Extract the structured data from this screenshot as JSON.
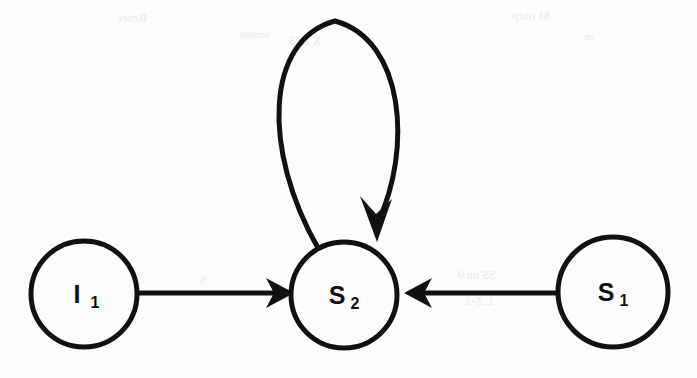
{
  "diagram": {
    "background_color": "#fdfdfd",
    "ink_color": "#111111",
    "nodes": [
      {
        "id": "I1",
        "name": "initial-state-node",
        "label_main": "I",
        "label_sub": "1",
        "cx": 84,
        "cy": 294,
        "r": 53,
        "stroke_width": 5
      },
      {
        "id": "S2",
        "name": "state-node-s2",
        "label_main": "S",
        "label_sub": "2",
        "cx": 344,
        "cy": 295,
        "r": 53,
        "stroke_width": 5
      },
      {
        "id": "S1",
        "name": "state-node-s1",
        "label_main": "S",
        "label_sub": "1",
        "cx": 613,
        "cy": 292,
        "r": 55,
        "stroke_width": 5
      }
    ],
    "edges": [
      {
        "id": "e-i1-s2",
        "name": "transition-i1-to-s2",
        "from": "I1",
        "to": "S2",
        "kind": "straight",
        "direction": "right",
        "label": "",
        "path": "M 139 293 L 278 293",
        "stroke_width": 5,
        "arrowhead": "266,278 294,293 266,308 274,293"
      },
      {
        "id": "e-s1-s2",
        "name": "transition-s1-to-s2",
        "from": "S1",
        "to": "S2",
        "kind": "straight",
        "direction": "left",
        "label": "",
        "path": "M 557 293 L 420 293",
        "stroke_width": 5,
        "arrowhead": "432,278 404,293 432,308 424,293"
      },
      {
        "id": "e-s2-s2",
        "name": "self-loop-s2",
        "from": "S2",
        "to": "S2",
        "kind": "self-loop",
        "direction": "clockwise",
        "label": "",
        "path": "M 318 248 C 262 150 265 40 335 21 C 405 40 412 150 378 222",
        "stroke_width": 5,
        "arrowhead": "360,196 377,242 392,199 376,214"
      }
    ],
    "bleed_through": [
      {
        "text": "Reset",
        "x": 118,
        "y": 10,
        "size": 13
      },
      {
        "text": "enable",
        "x": 240,
        "y": 28,
        "size": 11
      },
      {
        "text": "X 0.5S",
        "x": 288,
        "y": 34,
        "size": 12
      },
      {
        "text": "M outp",
        "x": 512,
        "y": 8,
        "size": 13
      },
      {
        "text": "or",
        "x": 584,
        "y": 30,
        "size": 11
      },
      {
        "text": "clock / re",
        "x": 52,
        "y": 266,
        "size": 12
      },
      {
        "text": "then write",
        "x": 46,
        "y": 292,
        "size": 12
      },
      {
        "text": "S",
        "x": 200,
        "y": 272,
        "size": 13
      },
      {
        "text": "SS on 0",
        "x": 458,
        "y": 268,
        "size": 12
      },
      {
        "text": "L Z-3",
        "x": 466,
        "y": 294,
        "size": 12
      }
    ]
  }
}
